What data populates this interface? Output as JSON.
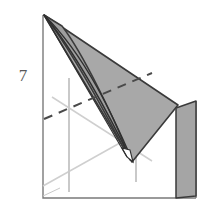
{
  "figure": {
    "number_label": "7",
    "type": "geometric-perspective-drawing",
    "background_color": "#ffffff",
    "colors": {
      "shaded_fill": "#a8a8a8",
      "wall_fill": "#a5a5a5",
      "outline_dark": "#3a3a3a",
      "frame_stroke": "#6e6e6e",
      "construction_light": "#c4c4c4",
      "construction_very_light": "#d2d2d2",
      "dashed_stroke": "#4a4a4a",
      "label_color": "#585858"
    },
    "elements": {
      "frame_label": "base-square-frame",
      "shaded_solid_label": "shaded-cone-solid",
      "wall_label": "vertical-wall-panel",
      "dashed_label": "hidden-edge-dashed-line",
      "construction_label": "construction-lines",
      "apex_label": "apex-vertex",
      "cone_tip_label": "cone-tip-vertex"
    },
    "geometry": {
      "apex": [
        44,
        15
      ],
      "bottom_left": [
        43,
        198
      ],
      "bottom_right": [
        196,
        198
      ],
      "right_corner": [
        178,
        105
      ],
      "cone_tip": [
        132,
        162
      ],
      "cone_tip_secondary": [
        127,
        157
      ],
      "wall_top_left": [
        176,
        108
      ],
      "wall_top_right": [
        196,
        101
      ],
      "wall_bottom_left": [
        176,
        198
      ],
      "wall_bottom_right": [
        196,
        196
      ],
      "dashed_start": [
        44,
        118
      ],
      "dashed_end": [
        150,
        74
      ]
    }
  }
}
